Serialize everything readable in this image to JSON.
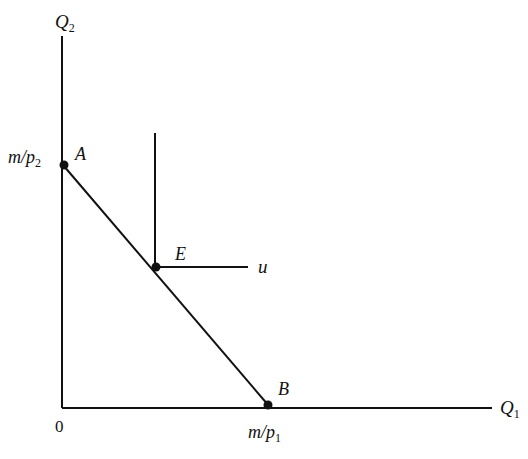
{
  "diagram": {
    "type": "budget-constraint-with-leontief-indifference",
    "axes": {
      "y_label": "Q",
      "y_sub": "2",
      "x_label": "Q",
      "x_sub": "1",
      "origin": "0"
    },
    "intercepts": {
      "y_label": "m/p",
      "y_sub": "2",
      "x_label": "m/p",
      "x_sub": "1"
    },
    "points": [
      {
        "id": "A",
        "label": "A"
      },
      {
        "id": "B",
        "label": "B"
      },
      {
        "id": "E",
        "label": "E"
      }
    ],
    "indifference_curve_label": "u",
    "colors": {
      "line": "#111111",
      "background": "#ffffff"
    }
  }
}
